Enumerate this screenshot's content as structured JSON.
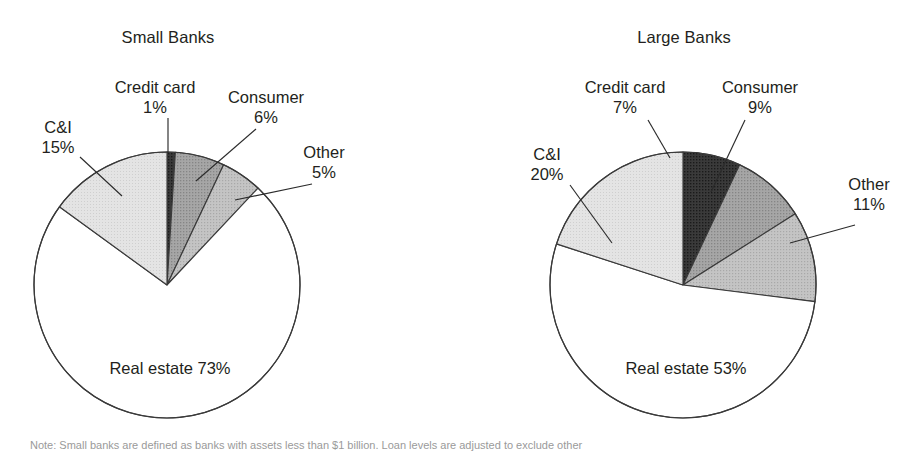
{
  "figure": {
    "background": "#ffffff",
    "footnote": "Note: Small banks are defined as banks with assets less than $1 billion. Loan levels are adjusted to exclude other"
  },
  "chart_data": [
    {
      "type": "pie",
      "title": "Small Banks",
      "unit": "percent",
      "start_angle_deg": 0,
      "direction": "clockwise",
      "categories": [
        "Credit card",
        "Consumer",
        "Other",
        "Real estate",
        "C&I"
      ],
      "values": [
        1,
        6,
        5,
        73,
        15
      ],
      "labels": [
        {
          "name": "Credit card",
          "pct": "1%"
        },
        {
          "name": "Consumer",
          "pct": "6%"
        },
        {
          "name": "Other",
          "pct": "5%"
        },
        {
          "name": "Real estate",
          "pct": "73%"
        },
        {
          "name": "C&I",
          "pct": "15%"
        }
      ],
      "slice_colors": [
        "#2e2e2e",
        "#9a9a9a",
        "#bdbdbd",
        "#ffffff",
        "#e0e0e0"
      ],
      "legend": "none",
      "grid": false
    },
    {
      "type": "pie",
      "title": "Large Banks",
      "unit": "percent",
      "start_angle_deg": 0,
      "direction": "clockwise",
      "categories": [
        "Credit card",
        "Consumer",
        "Other",
        "Real estate",
        "C&I"
      ],
      "values": [
        7,
        9,
        11,
        53,
        20
      ],
      "labels": [
        {
          "name": "Credit card",
          "pct": "7%"
        },
        {
          "name": "Consumer",
          "pct": "9%"
        },
        {
          "name": "Other",
          "pct": "11%"
        },
        {
          "name": "Real estate",
          "pct": "53%"
        },
        {
          "name": "C&I",
          "pct": "20%"
        }
      ],
      "slice_colors": [
        "#2e2e2e",
        "#9a9a9a",
        "#bdbdbd",
        "#ffffff",
        "#e0e0e0"
      ],
      "legend": "none",
      "grid": false
    }
  ]
}
